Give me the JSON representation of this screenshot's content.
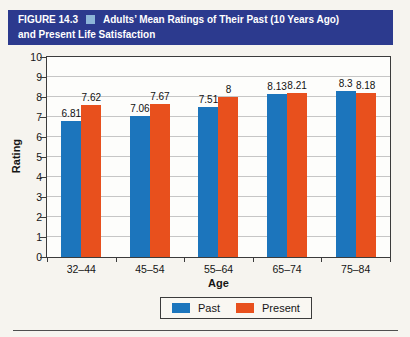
{
  "figure": {
    "label": "FIGURE 14.3",
    "title_line1": "Adults’ Mean Ratings of Their Past (10 Years Ago)",
    "title_line2": "and Present Life Satisfaction"
  },
  "chart_data": {
    "type": "bar",
    "title": "Adults’ Mean Ratings of Their Past (10 Years Ago) and Present Life Satisfaction",
    "categories": [
      "32–44",
      "45–54",
      "55–64",
      "65–74",
      "75–84"
    ],
    "series": [
      {
        "name": "Past",
        "color": "#1c75bc",
        "values": [
          6.81,
          7.06,
          7.51,
          8.13,
          8.3
        ],
        "labels": [
          "6.81",
          "7.06",
          "7.51",
          "8.13",
          "8.3"
        ]
      },
      {
        "name": "Present",
        "color": "#e8501d",
        "values": [
          7.62,
          7.67,
          8.0,
          8.21,
          8.18
        ],
        "labels": [
          "7.62",
          "7.67",
          "8",
          "8.21",
          "8.18"
        ]
      }
    ],
    "xlabel": "Age",
    "ylabel": "Rating",
    "ylim": [
      0,
      10
    ],
    "ytick_step": 1,
    "grid": true,
    "legend_position": "bottom"
  },
  "colors": {
    "title_bar_bg": "#2c3a8e",
    "title_bar_text": "#ffffff",
    "title_square": "#8cb5d8",
    "past_bar": "#1c75bc",
    "present_bar": "#e8501d",
    "gridline": "#c6c6c6",
    "plot_border": "#3b3b3b",
    "page_bg": "#f6f4ef"
  }
}
